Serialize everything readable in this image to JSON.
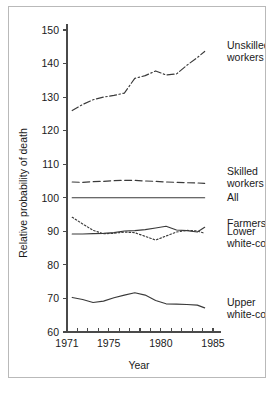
{
  "figure": {
    "background_color": "#ffffff",
    "frame_color": "#b9b9b9",
    "line_color": "#3a3a3a"
  },
  "chart_data": {
    "type": "line",
    "title": "",
    "xlabel": "Year",
    "ylabel": "Relative probability of death",
    "xlim": [
      1971,
      1985
    ],
    "ylim": [
      60,
      150
    ],
    "xticks": [
      1971,
      1972,
      1973,
      1974,
      1975,
      1976,
      1977,
      1978,
      1979,
      1980,
      1981,
      1982,
      1983,
      1984,
      1985
    ],
    "xtick_labels": [
      "1971",
      "",
      "",
      "",
      "1975",
      "",
      "",
      "",
      "",
      "1980",
      "",
      "",
      "",
      "",
      "1985"
    ],
    "yticks": [
      60,
      70,
      80,
      90,
      100,
      110,
      120,
      130,
      140,
      150
    ],
    "ytick_labels": [
      "60",
      "70",
      "80",
      "90",
      "100",
      "110",
      "120",
      "130",
      "140",
      "150"
    ],
    "grid": false,
    "legend_position": "right-inline",
    "x": [
      1971.5,
      1972.5,
      1973.5,
      1974.5,
      1975.5,
      1976.5,
      1977.5,
      1978.5,
      1979.5,
      1980.5,
      1981.5,
      1982.5,
      1983.5,
      1984.2
    ],
    "series": [
      {
        "name": "Unskilled workers",
        "label_lines": [
          "Unskilled",
          "workers"
        ],
        "style": "dash-dot",
        "dasharray": "7,2.5,1.5,2.5",
        "values": [
          126.0,
          127.8,
          129.2,
          130.0,
          130.5,
          131.2,
          135.6,
          136.4,
          137.8,
          136.6,
          136.9,
          139.5,
          141.8,
          143.6
        ],
        "label_y_value": 144.0
      },
      {
        "name": "Skilled workers",
        "label_lines": [
          "Skilled",
          "workers"
        ],
        "style": "dashed",
        "dasharray": "7,3.5",
        "values": [
          104.7,
          104.6,
          104.8,
          104.9,
          105.1,
          105.2,
          105.2,
          105.0,
          104.9,
          104.7,
          104.6,
          104.5,
          104.4,
          104.3
        ],
        "label_y_value": 106.5
      },
      {
        "name": "All",
        "label_lines": [
          "All"
        ],
        "style": "solid",
        "dasharray": "",
        "values": [
          100,
          100,
          100,
          100,
          100,
          100,
          100,
          100,
          100,
          100,
          100,
          100,
          100,
          100
        ],
        "label_y_value": 100.0
      },
      {
        "name": "Farmers",
        "label_lines": [
          "Farmers"
        ],
        "style": "solid",
        "dasharray": "",
        "values": [
          89.2,
          89.2,
          89.3,
          89.4,
          89.6,
          90.1,
          90.2,
          90.5,
          91.0,
          91.5,
          90.4,
          90.2,
          89.8,
          91.2
        ],
        "label_y_value": 92.5
      },
      {
        "name": "Lower white-collar",
        "label_lines": [
          "Lower",
          "white-collar"
        ],
        "style": "dotted",
        "dasharray": "1.6,2.0",
        "values": [
          94.2,
          92.2,
          90.3,
          89.3,
          89.4,
          89.8,
          89.6,
          88.5,
          87.4,
          88.6,
          89.8,
          90.3,
          90.1,
          89.4
        ],
        "label_y_value": 88.5
      },
      {
        "name": "Upper white-collar",
        "label_lines": [
          "Upper",
          "white-collar"
        ],
        "style": "solid",
        "dasharray": "",
        "values": [
          70.3,
          69.7,
          68.8,
          69.2,
          70.2,
          71.0,
          71.7,
          71.0,
          69.4,
          68.4,
          68.3,
          68.2,
          68.0,
          67.2
        ],
        "label_y_value": 67.4
      }
    ]
  }
}
